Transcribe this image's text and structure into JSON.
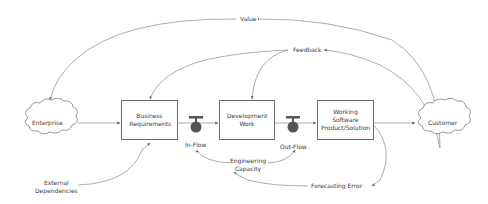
{
  "diagram": {
    "nodes": {
      "enterprise": "Enterprise",
      "business_requirements": "Business Requirements",
      "development_work": "Development Work",
      "working_software": "Working Software Product/Solution",
      "customer": "Customer"
    },
    "valves": {
      "in_flow": "In-Flow",
      "out_flow": "Out-Flow"
    },
    "labels": {
      "value": "Value",
      "feedback": "Feedback",
      "external_dependencies_line1": "External",
      "external_dependencies_line2": "Dependencies",
      "engineering_capacity_line1": "Engineering",
      "engineering_capacity_line2": "Capacity",
      "forecasting_error": "Forecasting Error"
    },
    "colors": {
      "line": "#8a8a8a",
      "box_border": "#6b6b6b",
      "valve": "#555555",
      "text": "#3a3a3a"
    }
  }
}
